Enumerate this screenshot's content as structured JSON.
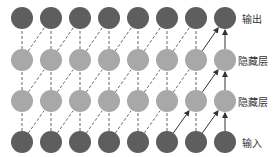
{
  "diagram": {
    "columns": 8,
    "column_x": [
      22,
      51,
      80,
      109,
      138,
      167,
      196,
      225
    ],
    "rows": [
      {
        "name": "output",
        "label": "输出",
        "y": 18,
        "color": "#5e5e5e"
      },
      {
        "name": "hidden-2",
        "label": "隐藏层",
        "y": 60,
        "color": "#a8a8a8"
      },
      {
        "name": "hidden-1",
        "label": "隐藏层",
        "y": 101,
        "color": "#a8a8a8"
      },
      {
        "name": "input",
        "label": "输入",
        "y": 142,
        "color": "#5e5e5e"
      }
    ],
    "radius": 11,
    "edge_color": "#444444",
    "highlight_column": 7
  },
  "labels": {
    "output": "输出",
    "hidden2": "隐藏层",
    "hidden1": "隐藏层",
    "input": "输入"
  }
}
